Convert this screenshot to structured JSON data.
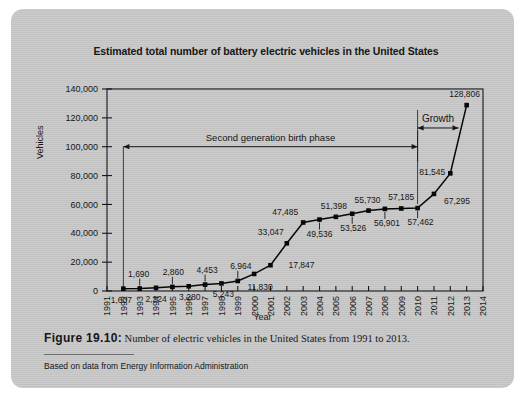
{
  "figure": {
    "label": "Figure 19.10:",
    "caption": "Number of electric vehicles in the United States from 1991 to 2013.",
    "source": "Based on data from Energy Information Administration"
  },
  "chart_data": {
    "type": "line",
    "title": "Estimated total number of battery electric vehicles in the United States",
    "xlabel": "Year",
    "ylabel": "Vehicles",
    "xlim": [
      1991,
      2014
    ],
    "ylim": [
      0,
      140000
    ],
    "ytick_step": 20000,
    "grid": false,
    "legend": "none",
    "marker": "square",
    "line_color": "#000000",
    "x": [
      1991,
      1992,
      1993,
      1994,
      1995,
      1996,
      1997,
      1998,
      1999,
      2000,
      2001,
      2002,
      2003,
      2004,
      2005,
      2006,
      2007,
      2008,
      2009,
      2010,
      2011,
      2012,
      2013,
      2014
    ],
    "xticklabels": [
      "1991",
      "1992",
      "1993",
      "1994",
      "1995",
      "1996",
      "1997",
      "1998",
      "1999",
      "2000",
      "2001",
      "2002",
      "2003",
      "2004",
      "2005",
      "2006",
      "2007",
      "2008",
      "2009",
      "2010",
      "2011",
      "2012",
      "2013",
      "2014"
    ],
    "yticklabels": [
      "0",
      "20,000",
      "40,000",
      "60,000",
      "80,000",
      "100,000",
      "120,000",
      "140,000"
    ],
    "yticks": [
      0,
      20000,
      40000,
      60000,
      80000,
      100000,
      120000,
      140000
    ],
    "categories": [
      1992,
      1993,
      1994,
      1995,
      1996,
      1997,
      1998,
      1999,
      2000,
      2001,
      2002,
      2003,
      2004,
      2005,
      2006,
      2007,
      2008,
      2009,
      2010,
      2011,
      2012,
      2013
    ],
    "values": [
      1607,
      1690,
      2224,
      2860,
      3280,
      4453,
      5243,
      6964,
      11830,
      17847,
      33047,
      47485,
      49536,
      51398,
      53526,
      55730,
      56901,
      57185,
      57462,
      67295,
      81545,
      128806
    ],
    "point_labels": [
      "1,607",
      "1,690",
      "2,224",
      "2,860",
      "3,280",
      "4,453",
      "5,243",
      "6,964",
      "11,830",
      "17,847",
      "33,047",
      "47,485",
      "49,536",
      "51,398",
      "53,526",
      "55,730",
      "56,901",
      "57,185",
      "57,462",
      "67,295",
      "81,545",
      "128,806"
    ],
    "annotations": [
      {
        "text": "Second generation birth phase",
        "from_x": 1992,
        "to_x": 2010,
        "at_y": 100000
      },
      {
        "text": "Growth",
        "from_x": 2010,
        "to_x": 2012.5,
        "at_y": 113000
      }
    ]
  }
}
